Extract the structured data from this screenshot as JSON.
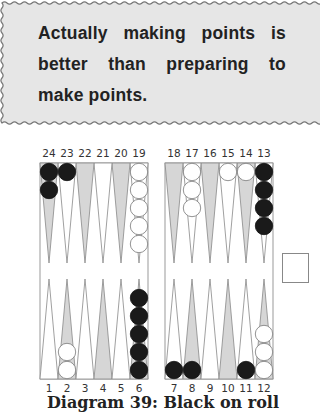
{
  "callout": {
    "text": "Actually making points is better than preparing to make points.",
    "background": "#e6e6e6"
  },
  "board": {
    "top_labels": [
      "24",
      "23",
      "22",
      "21",
      "20",
      "19",
      "18",
      "17",
      "16",
      "15",
      "14",
      "13"
    ],
    "bottom_labels": [
      "1",
      "2",
      "3",
      "4",
      "5",
      "6",
      "7",
      "8",
      "9",
      "10",
      "11",
      "12"
    ],
    "positions": {
      "black": {
        "24": 2,
        "23": 1,
        "13": 4,
        "6": 5,
        "7": 1,
        "8": 1,
        "11": 1
      },
      "white": {
        "19": 5,
        "17": 3,
        "15": 1,
        "14": 1,
        "2": 2,
        "12": 3
      }
    },
    "colors": {
      "black": "#1a1a1a",
      "white": "#ffffff",
      "shaded_point": "#d6d6d6",
      "border": "#999999"
    },
    "cube": {
      "value": ""
    }
  },
  "caption": "Diagram 39: Black on roll"
}
